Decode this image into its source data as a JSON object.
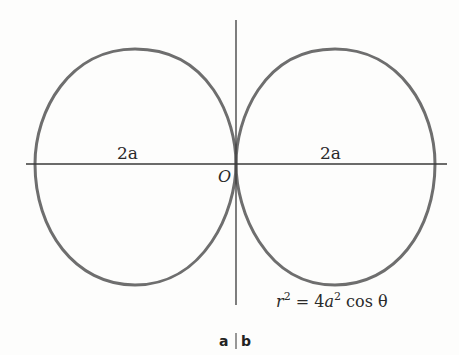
{
  "figure": {
    "colors": {
      "background": "#fdfdfc",
      "axis": "#3a3a3a",
      "curve": "#6e6e6e",
      "text": "#2a2a2a"
    },
    "labels": {
      "left_distance": "2a",
      "right_distance": "2a",
      "origin": "O",
      "equation_r": "r",
      "equation_r_exp": "2",
      "equation_eq": " = 4",
      "equation_a": "a",
      "equation_a_exp": "2",
      "equation_rest": " cos θ",
      "panel_a": "a",
      "panel_b": "b"
    },
    "equation": "r² = 4a² cos θ",
    "geometry": {
      "origin": [
        236,
        164
      ],
      "h_axis": [
        26,
        447
      ],
      "v_axis": [
        20,
        305
      ],
      "left_loop": {
        "leftmost_x": 35,
        "top_y": 49,
        "bottom_y": 285
      },
      "right_loop": {
        "rightmost_x": 435,
        "top_y": 49,
        "bottom_y": 285
      }
    }
  }
}
